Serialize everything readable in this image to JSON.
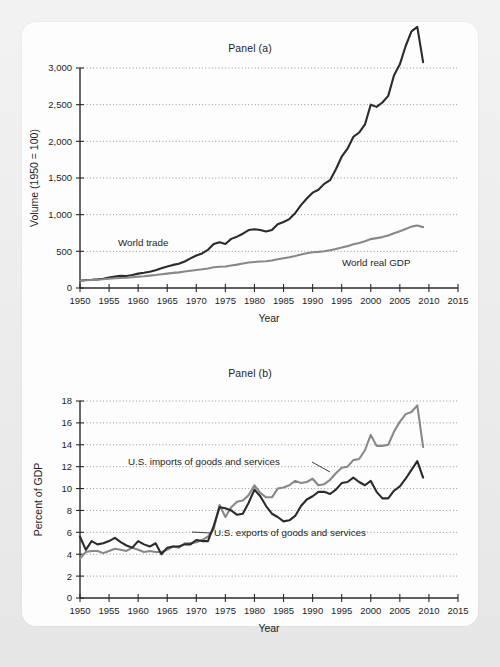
{
  "figure": {
    "background_color": "#e9e9e9",
    "card_color": "#fdfdfd",
    "dark_series_color": "#2b2b2b",
    "gray_series_color": "#888888"
  },
  "chart_data": [
    {
      "type": "line",
      "title": "Panel (a)",
      "xlabel": "Year",
      "ylabel": "Volume (1950 = 100)",
      "xlim": [
        1950,
        2015
      ],
      "ylim": [
        0,
        3000
      ],
      "xticks": [
        1950,
        1955,
        1960,
        1965,
        1970,
        1975,
        1980,
        1985,
        1990,
        1995,
        2000,
        2005,
        2010,
        2015
      ],
      "yticks": [
        0,
        500,
        1000,
        1500,
        2000,
        2500,
        3000
      ],
      "xtick_labels": [
        "1950",
        "1955",
        "1960",
        "1965",
        "1970",
        "1975",
        "1980",
        "1985",
        "1990",
        "1995",
        "2000",
        "2005",
        "2010",
        "2015"
      ],
      "ytick_labels": [
        "0",
        "500",
        "1,000",
        "1,500",
        "2,000",
        "2,500",
        "3,000"
      ],
      "grid": true,
      "legend_position": "inline-annotation",
      "series": [
        {
          "name": "World trade",
          "color": "#2b2b2b",
          "label_text": "World trade",
          "x": [
            1950,
            1951,
            1952,
            1953,
            1954,
            1955,
            1956,
            1957,
            1958,
            1959,
            1960,
            1961,
            1962,
            1963,
            1964,
            1965,
            1966,
            1967,
            1968,
            1969,
            1970,
            1971,
            1972,
            1973,
            1974,
            1975,
            1976,
            1977,
            1978,
            1979,
            1980,
            1981,
            1982,
            1983,
            1984,
            1985,
            1986,
            1987,
            1988,
            1989,
            1990,
            1991,
            1992,
            1993,
            1994,
            1995,
            1996,
            1997,
            1998,
            1999,
            2000,
            2001,
            2002,
            2003,
            2004,
            2005,
            2006,
            2007,
            2008,
            2009
          ],
          "y": [
            100,
            110,
            112,
            118,
            127,
            142,
            155,
            165,
            163,
            178,
            196,
            207,
            222,
            241,
            269,
            292,
            315,
            330,
            362,
            404,
            444,
            472,
            521,
            600,
            625,
            600,
            670,
            700,
            740,
            790,
            800,
            790,
            770,
            790,
            870,
            900,
            940,
            1020,
            1130,
            1220,
            1300,
            1340,
            1420,
            1470,
            1620,
            1790,
            1900,
            2060,
            2120,
            2230,
            2500,
            2470,
            2530,
            2620,
            2900,
            3050,
            3300,
            3500,
            3560,
            3080
          ]
        },
        {
          "name": "World real GDP",
          "color": "#888888",
          "label_text": "World real GDP",
          "x": [
            1950,
            1951,
            1952,
            1953,
            1954,
            1955,
            1956,
            1957,
            1958,
            1959,
            1960,
            1961,
            1962,
            1963,
            1964,
            1965,
            1966,
            1967,
            1968,
            1969,
            1970,
            1971,
            1972,
            1973,
            1974,
            1975,
            1976,
            1977,
            1978,
            1979,
            1980,
            1981,
            1982,
            1983,
            1984,
            1985,
            1986,
            1987,
            1988,
            1989,
            1990,
            1991,
            1992,
            1993,
            1994,
            1995,
            1996,
            1997,
            1998,
            1999,
            2000,
            2001,
            2002,
            2003,
            2004,
            2005,
            2006,
            2007,
            2008,
            2009
          ],
          "y": [
            100,
            106,
            110,
            115,
            119,
            126,
            132,
            137,
            140,
            147,
            155,
            161,
            169,
            177,
            187,
            196,
            206,
            213,
            224,
            236,
            246,
            255,
            267,
            282,
            289,
            293,
            307,
            319,
            333,
            347,
            354,
            361,
            365,
            376,
            392,
            406,
            420,
            436,
            456,
            473,
            487,
            493,
            502,
            514,
            533,
            551,
            571,
            596,
            613,
            637,
            667,
            680,
            694,
            716,
            747,
            773,
            805,
            837,
            851,
            830
          ]
        }
      ]
    },
    {
      "type": "line",
      "title": "Panel (b)",
      "xlabel": "Year",
      "ylabel": "Percent of GDP",
      "xlim": [
        1950,
        2015
      ],
      "ylim": [
        0,
        18
      ],
      "xticks": [
        1950,
        1955,
        1960,
        1965,
        1970,
        1975,
        1980,
        1985,
        1990,
        1995,
        2000,
        2005,
        2010,
        2015
      ],
      "yticks": [
        0,
        2,
        4,
        6,
        8,
        10,
        12,
        14,
        16,
        18
      ],
      "xtick_labels": [
        "1950",
        "1955",
        "1960",
        "1965",
        "1970",
        "1975",
        "1980",
        "1985",
        "1990",
        "1995",
        "2000",
        "2005",
        "2010",
        "2015"
      ],
      "ytick_labels": [
        "0",
        "2",
        "4",
        "6",
        "8",
        "10",
        "12",
        "14",
        "16",
        "18"
      ],
      "grid": true,
      "legend_position": "inline-annotation",
      "series": [
        {
          "name": "U.S. imports of goods and services",
          "color": "#888888",
          "label_text": "U.S. imports of goods and services",
          "x": [
            1950,
            1951,
            1952,
            1953,
            1954,
            1955,
            1956,
            1957,
            1958,
            1959,
            1960,
            1961,
            1962,
            1963,
            1964,
            1965,
            1966,
            1967,
            1968,
            1969,
            1970,
            1971,
            1972,
            1973,
            1974,
            1975,
            1976,
            1977,
            1978,
            1979,
            1980,
            1981,
            1982,
            1983,
            1984,
            1985,
            1986,
            1987,
            1988,
            1989,
            1990,
            1991,
            1992,
            1993,
            1994,
            1995,
            1996,
            1997,
            1998,
            1999,
            2000,
            2001,
            2002,
            2003,
            2004,
            2005,
            2006,
            2007,
            2008,
            2009
          ],
          "y": [
            3.6,
            4.2,
            4.3,
            4.3,
            4.1,
            4.3,
            4.5,
            4.4,
            4.3,
            4.6,
            4.4,
            4.2,
            4.3,
            4.2,
            4.2,
            4.4,
            4.7,
            4.6,
            5.0,
            5.0,
            5.1,
            5.3,
            5.6,
            6.3,
            8.5,
            7.4,
            8.3,
            8.8,
            8.9,
            9.4,
            10.3,
            9.6,
            9.2,
            9.2,
            10.0,
            10.1,
            10.3,
            10.7,
            10.5,
            10.6,
            10.9,
            10.3,
            10.4,
            10.8,
            11.4,
            11.9,
            12.0,
            12.6,
            12.7,
            13.5,
            14.9,
            13.9,
            13.9,
            14.0,
            15.2,
            16.1,
            16.8,
            17.0,
            17.6,
            13.8
          ]
        },
        {
          "name": "U.S. exports of goods and services",
          "color": "#2b2b2b",
          "label_text": "U.S. exports of goods and services",
          "x": [
            1950,
            1951,
            1952,
            1953,
            1954,
            1955,
            1956,
            1957,
            1958,
            1959,
            1960,
            1961,
            1962,
            1963,
            1964,
            1965,
            1966,
            1967,
            1968,
            1969,
            1970,
            1971,
            1972,
            1973,
            1974,
            1975,
            1976,
            1977,
            1978,
            1979,
            1980,
            1981,
            1982,
            1983,
            1984,
            1985,
            1986,
            1987,
            1988,
            1989,
            1990,
            1991,
            1992,
            1993,
            1994,
            1995,
            1996,
            1997,
            1998,
            1999,
            2000,
            2001,
            2002,
            2003,
            2004,
            2005,
            2006,
            2007,
            2008,
            2009
          ],
          "y": [
            5.6,
            4.4,
            5.2,
            4.9,
            5.0,
            5.2,
            5.5,
            5.1,
            4.8,
            4.6,
            5.2,
            4.9,
            4.7,
            5.0,
            4.0,
            4.6,
            4.7,
            4.7,
            4.9,
            4.9,
            5.3,
            5.2,
            5.2,
            6.6,
            8.3,
            8.2,
            8.0,
            7.6,
            7.7,
            8.7,
            9.9,
            9.3,
            8.4,
            7.7,
            7.4,
            7.0,
            7.1,
            7.5,
            8.4,
            9.0,
            9.3,
            9.7,
            9.7,
            9.5,
            9.9,
            10.5,
            10.6,
            11.0,
            10.6,
            10.3,
            10.7,
            9.7,
            9.1,
            9.1,
            9.8,
            10.2,
            10.9,
            11.7,
            12.5,
            11.0
          ]
        }
      ]
    }
  ]
}
